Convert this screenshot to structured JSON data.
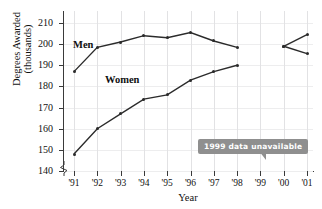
{
  "chart_data": {
    "type": "line",
    "title": "",
    "xlabel": "Year",
    "ylabel_line1": "Degrees Awarded",
    "ylabel_line2": "(thousands)",
    "categories": [
      "'91",
      "'92",
      "'93",
      "'94",
      "'95",
      "'96",
      "'97",
      "'98",
      "'99",
      "'00",
      "'01"
    ],
    "ylim": [
      140,
      210
    ],
    "yticks": [
      140,
      150,
      160,
      170,
      180,
      190,
      200,
      210
    ],
    "ytick_labels": [
      "140",
      "150",
      "160",
      "170",
      "180",
      "190",
      "200",
      "210"
    ],
    "y_axis_break": true,
    "grid": true,
    "legend_position": "inline-labels",
    "series": [
      {
        "name": "Men",
        "label": "Men",
        "color": "#2b2b2b",
        "values": [
          187,
          198.5,
          201,
          204,
          203,
          205.5,
          201.5,
          198.5,
          null,
          199,
          195.5
        ]
      },
      {
        "name": "Women",
        "label": "Women",
        "color": "#2b2b2b",
        "values": [
          148,
          160,
          167,
          174,
          176,
          183,
          187,
          190,
          null,
          199,
          204.5
        ]
      }
    ],
    "annotations": [
      {
        "text": "1999 data unavailable",
        "points_to": "'99",
        "background": "#8f8f8f",
        "text_color": "#ffffff"
      }
    ]
  }
}
